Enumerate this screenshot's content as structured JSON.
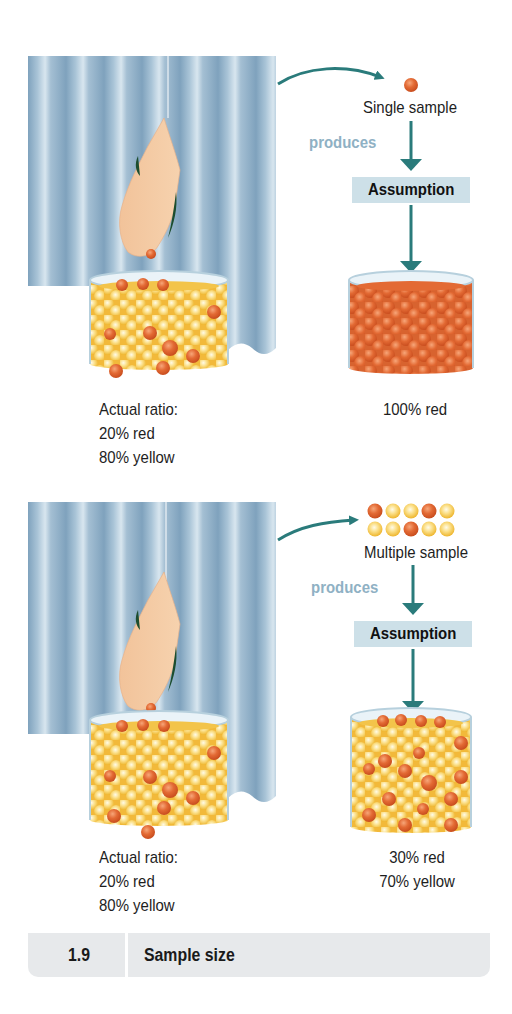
{
  "figure": {
    "number": "1.9",
    "caption": "Sample size"
  },
  "panels": [
    {
      "id": "single",
      "sample_label": "Single sample",
      "produces_label": "produces",
      "assumption_label": "Assumption",
      "actual_ratio": {
        "heading": "Actual ratio:",
        "red": "20% red",
        "yellow": "80% yellow"
      },
      "assumed_ratio": {
        "line1": "100% red",
        "line2": ""
      },
      "sample_balls": [
        "red"
      ]
    },
    {
      "id": "multiple",
      "sample_label": "Multiple sample",
      "produces_label": "produces",
      "assumption_label": "Assumption",
      "actual_ratio": {
        "heading": "Actual ratio:",
        "red": "20% red",
        "yellow": "80% yellow"
      },
      "assumed_ratio": {
        "line1": "30% red",
        "line2": "70% yellow"
      },
      "sample_balls": [
        [
          "red",
          "yellow",
          "yellow",
          "red",
          "yellow"
        ],
        [
          "yellow",
          "yellow",
          "red",
          "yellow",
          "yellow"
        ]
      ]
    }
  ],
  "colors": {
    "curtain_base": "#8fb0c8",
    "curtain_light": "#c9dbe7",
    "arrow_teal": "#2a7b7b",
    "produces_text": "#8fb1c4",
    "assumption_bg": "#cde0e8",
    "ball_red": "#e0662e",
    "ball_yellow": "#f4c23c",
    "footer_bg": "#e7e9eb"
  }
}
